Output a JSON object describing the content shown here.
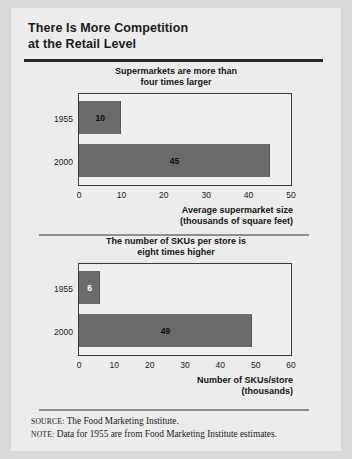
{
  "figure": {
    "title_line1": "There Is More Competition",
    "title_line2": "at the Retail Level",
    "source_label": "SOURCE:",
    "source_text": "The Food Marketing Institute.",
    "note_label": "NOTE:",
    "note_text": "Data for 1955 are from Food Marketing Institute estimates.",
    "bar_color": "#6b6b6b",
    "card_color": "#ececec",
    "background_color": "#d9d9d9",
    "rule_color": "#2a2a2a"
  },
  "chart_data": [
    {
      "type": "bar",
      "orientation": "horizontal",
      "title": "Supermarkets are more than four times larger",
      "title_line1": "Supermarkets are more than",
      "title_line2": "four times larger",
      "categories": [
        "1955",
        "2000"
      ],
      "values": [
        10,
        45
      ],
      "data_labels": [
        "10",
        "45"
      ],
      "xlabel": "Average supermarket size (thousands of square feet)",
      "xlabel_line1": "Average supermarket size",
      "xlabel_line2": "(thousands of square feet)",
      "ylabel": "",
      "xlim": [
        0,
        50
      ],
      "xticks": [
        0,
        10,
        20,
        30,
        40,
        50
      ],
      "xtick_labels": [
        "0",
        "10",
        "20",
        "30",
        "40",
        "50"
      ],
      "grid": false,
      "legend": "none"
    },
    {
      "type": "bar",
      "orientation": "horizontal",
      "title": "The number of SKUs per store is eight times higher",
      "title_line1": "The number of SKUs per store is",
      "title_line2": "eight times higher",
      "categories": [
        "1955",
        "2000"
      ],
      "values": [
        6,
        49
      ],
      "data_labels": [
        "6",
        "49"
      ],
      "xlabel": "Number of SKUs/store (thousands)",
      "xlabel_line1": "Number of SKUs/store",
      "xlabel_line2": "(thousands)",
      "ylabel": "",
      "xlim": [
        0,
        60
      ],
      "xticks": [
        0,
        10,
        20,
        30,
        40,
        50,
        60
      ],
      "xtick_labels": [
        "0",
        "10",
        "20",
        "30",
        "40",
        "50",
        "60"
      ],
      "grid": false,
      "legend": "none"
    }
  ]
}
